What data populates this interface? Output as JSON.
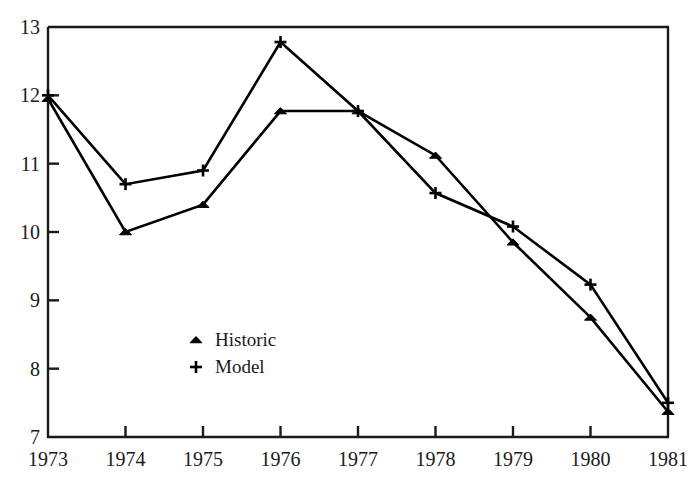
{
  "chart_data": {
    "type": "line",
    "title": "",
    "subtitle": "",
    "xlabel": "",
    "ylabel": "",
    "categories": [
      "1973",
      "1974",
      "1975",
      "1976",
      "1977",
      "1978",
      "1979",
      "1980",
      "1981"
    ],
    "x": [
      1973,
      1974,
      1975,
      1976,
      1977,
      1978,
      1979,
      1980,
      1981
    ],
    "series": [
      {
        "name": "Historic",
        "marker": "triangle",
        "color": "#000000",
        "values": [
          11.95,
          10.0,
          10.4,
          11.77,
          11.77,
          11.12,
          9.85,
          8.75,
          7.37
        ]
      },
      {
        "name": "Model",
        "marker": "plus",
        "color": "#000000",
        "values": [
          12.0,
          10.7,
          10.9,
          12.78,
          11.77,
          10.57,
          10.08,
          9.23,
          7.5
        ]
      }
    ],
    "xlim": [
      1973,
      1981
    ],
    "ylim": [
      7,
      13
    ],
    "ytick_labels": [
      "7",
      "8",
      "9",
      "10",
      "11",
      "12",
      "13"
    ],
    "yticks": [
      7,
      8,
      9,
      10,
      11,
      12,
      13
    ],
    "xtick_labels": [
      "1973",
      "1974",
      "1975",
      "1976",
      "1977",
      "1978",
      "1979",
      "1980",
      "1981"
    ],
    "grid": false,
    "legend_position": "inside-lower-left",
    "legend_entries": [
      {
        "label": "Historic",
        "marker": "triangle"
      },
      {
        "label": "Model",
        "marker": "plus"
      }
    ]
  },
  "axes": {
    "y_labels": [
      "13",
      "12",
      "11",
      "10",
      "9",
      "8",
      "7"
    ],
    "x_labels": [
      "1973",
      "1974",
      "1975",
      "1976",
      "1977",
      "1978",
      "1979",
      "1980",
      "1981"
    ]
  },
  "legend": {
    "historic_label": "Historic",
    "model_label": "Model"
  },
  "style": {
    "line_color": "#000000",
    "axis_color": "#1a1a1a",
    "background": "#ffffff"
  }
}
